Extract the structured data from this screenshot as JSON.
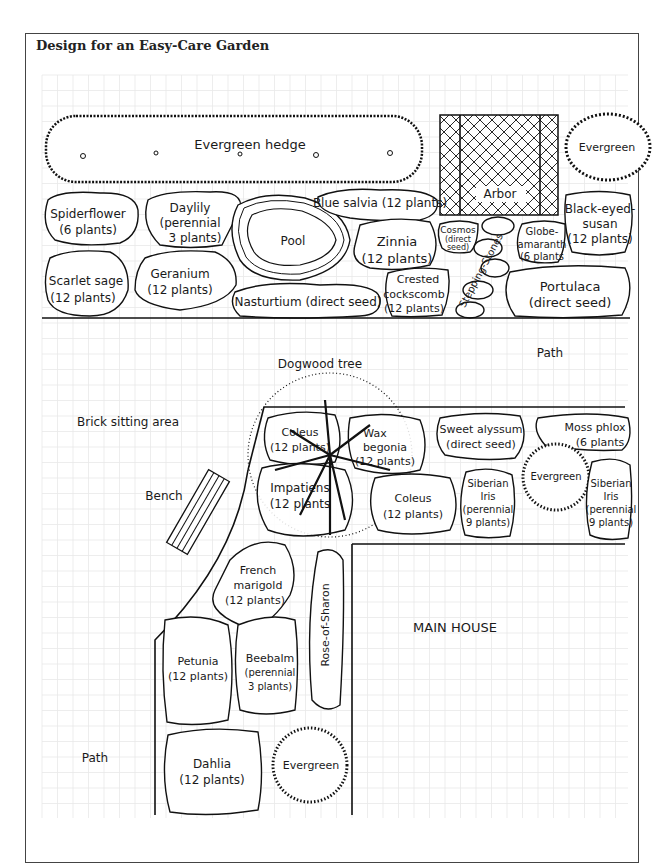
{
  "title": "Design for an Easy-Care Garden",
  "top_section": {
    "hedge": {
      "label": "Evergreen hedge"
    },
    "arbor": {
      "label": "Arbor"
    },
    "evergreen_top_right": {
      "label": "Evergreen"
    },
    "beds": [
      {
        "name": "Spiderflower",
        "detail": "(6 plants)"
      },
      {
        "name": "Daylily",
        "detail": "(perennial",
        "detail2": "3 plants)"
      },
      {
        "name": "Pool"
      },
      {
        "name": "Blue salvia (12 plants)"
      },
      {
        "name": "Cosmos",
        "detail": "(direct",
        "detail2": "seed)"
      },
      {
        "name": "Globe-",
        "detail": "amaranth",
        "detail2": "(6 plants"
      },
      {
        "name": "Black-eyed-",
        "detail": "susan",
        "detail2": "(12 plants)"
      },
      {
        "name": "Scarlet sage",
        "detail": "(12 plants)"
      },
      {
        "name": "Geranium",
        "detail": "(12 plants)"
      },
      {
        "name": "Zinnia",
        "detail": "(12 plants)"
      },
      {
        "name": "Nasturtium (direct seed)"
      },
      {
        "name": "Crested",
        "detail": "cockscomb",
        "detail2": "(12 plants)"
      },
      {
        "name": "Stepping-Stones"
      },
      {
        "name": "Portulaca",
        "detail": "(direct seed)"
      }
    ]
  },
  "middle_section": {
    "path_label_top": "Path",
    "dogwood": "Dogwood tree",
    "brick_area": "Brick sitting area",
    "bench": "Bench",
    "beds": [
      {
        "name": "Coleus",
        "detail": "(12 plants)"
      },
      {
        "name": "Wax",
        "detail": "begonia",
        "detail2": "(12 plants)"
      },
      {
        "name": "Impatiens",
        "detail": "(12 plants"
      },
      {
        "name": "Coleus",
        "detail": "(12 plants)"
      },
      {
        "name": "Sweet alyssum",
        "detail": "(direct seed)"
      },
      {
        "name": "Moss phlox",
        "detail": "(6 plants"
      },
      {
        "name": "Siberian",
        "detail": "Iris",
        "detail2": "(perennial",
        "detail3": "9 plants)"
      },
      {
        "name": "Evergreen"
      },
      {
        "name": "Siberian",
        "detail": "Iris",
        "detail2": "(perennial",
        "detail3": "9 plants)"
      }
    ]
  },
  "bottom_section": {
    "house": "MAIN HOUSE",
    "path_label_bottom": "Path",
    "beds": [
      {
        "name": "French",
        "detail": "marigold",
        "detail2": "(12 plants)"
      },
      {
        "name": "Rose-of-Sharon"
      },
      {
        "name": "Petunia",
        "detail": "(12 plants)"
      },
      {
        "name": "Beebalm",
        "detail": "(perennial",
        "detail2": "3 plants)"
      },
      {
        "name": "Dahlia",
        "detail": "(12 plants)"
      },
      {
        "name": "Evergreen"
      }
    ]
  }
}
